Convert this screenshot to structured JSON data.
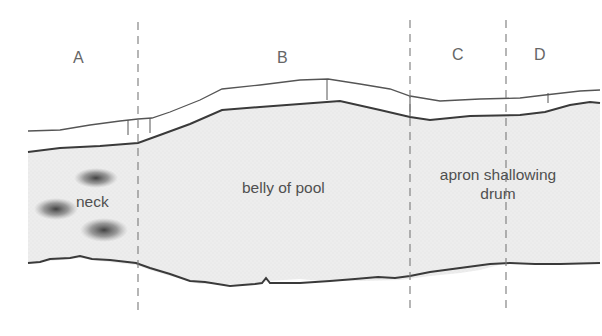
{
  "figure": {
    "zones": [
      {
        "id": "A",
        "label": "A"
      },
      {
        "id": "B",
        "label": "B"
      },
      {
        "id": "C",
        "label": "C"
      },
      {
        "id": "D",
        "label": "D"
      }
    ],
    "regions": {
      "neck": "neck",
      "belly": "belly of pool",
      "apron_line1": "apron shallowing",
      "apron_line2": "drum"
    },
    "colors": {
      "water_fill": "#ececec",
      "bank_line": "#3a3a3a",
      "dashed_line": "#7a7a7a",
      "shoal_dots": "#333333"
    }
  }
}
